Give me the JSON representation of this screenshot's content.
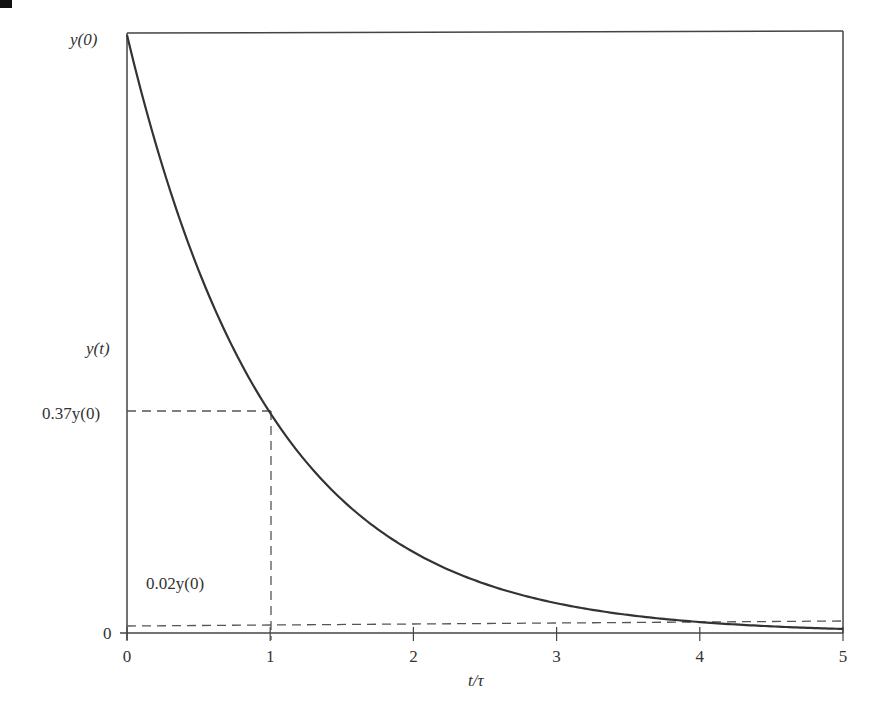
{
  "chart_data": {
    "type": "line",
    "title": "",
    "xlabel": "t/τ",
    "ylabel": "y(t)",
    "xlim": [
      0,
      5
    ],
    "ylim": [
      0,
      1
    ],
    "grid": false,
    "legend": null,
    "x_ticks": [
      "0",
      "1",
      "2",
      "3",
      "4",
      "5"
    ],
    "y_ticks": [
      {
        "label": "0",
        "value": 0
      },
      {
        "label": "0.02y(0)",
        "value": 0.02
      },
      {
        "label": "0.37y(0)",
        "value": 0.37
      },
      {
        "label": "y(0)",
        "value": 1.0
      }
    ],
    "series": [
      {
        "name": "y(t) = y(0)·e^(−t/τ)",
        "x": [
          0,
          0.25,
          0.5,
          0.75,
          1,
          1.5,
          2,
          2.5,
          3,
          3.5,
          4,
          4.5,
          5
        ],
        "values": [
          1.0,
          0.779,
          0.607,
          0.472,
          0.368,
          0.223,
          0.135,
          0.082,
          0.05,
          0.03,
          0.018,
          0.011,
          0.007
        ]
      }
    ],
    "annotations": [
      {
        "type": "dashed-hline",
        "y": 0.37,
        "x_from": 0,
        "x_to": 1,
        "label": "0.37y(0)"
      },
      {
        "type": "dashed-vline",
        "x": 1,
        "y_from": 0,
        "y_to": 0.37
      },
      {
        "type": "dashed-hline",
        "y": 0.02,
        "x_from": 0,
        "x_to": 5,
        "label": "0.02y(0)"
      }
    ]
  },
  "labels": {
    "y0": "y(0)",
    "yt": "y(t)",
    "y037": "0.37y(0)",
    "y002": "0.02y(0)",
    "zero": "0",
    "xaxis": "t/τ",
    "xticks": [
      "0",
      "1",
      "2",
      "3",
      "4",
      "5"
    ]
  }
}
